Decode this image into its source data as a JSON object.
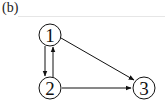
{
  "figure": {
    "label": "(b)",
    "nodes": [
      {
        "id": "1",
        "label": "1",
        "cx": 50,
        "cy": 35
      },
      {
        "id": "2",
        "label": "2",
        "cx": 50,
        "cy": 88
      },
      {
        "id": "3",
        "label": "3",
        "cx": 144,
        "cy": 88
      }
    ],
    "edges": [
      {
        "from": "1",
        "to": "2"
      },
      {
        "from": "2",
        "to": "1"
      },
      {
        "from": "1",
        "to": "3"
      },
      {
        "from": "2",
        "to": "3"
      }
    ],
    "colors": {
      "stroke": "#111111",
      "background": "#ffffff"
    }
  }
}
